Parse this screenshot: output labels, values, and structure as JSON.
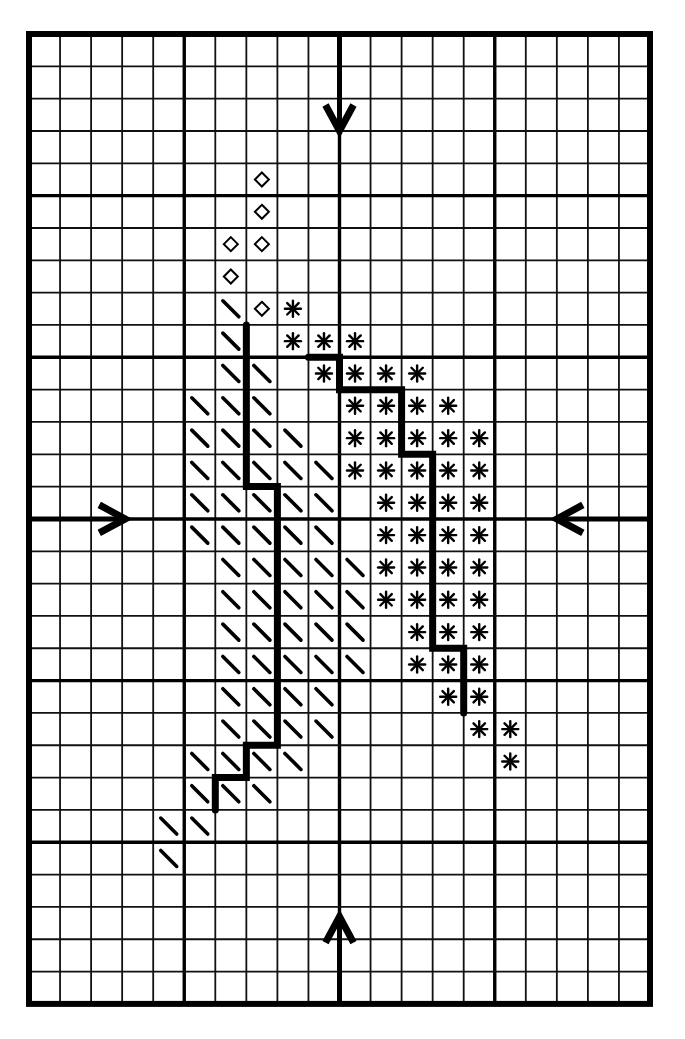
{
  "chart": {
    "grid": {
      "columns": 20,
      "rows": 30,
      "bold_every": 5,
      "origin_px": [
        29,
        34
      ],
      "cell_px": [
        31.05,
        32.33
      ]
    },
    "legend_symbols": [
      {
        "id": "diamond",
        "glyph": "◇"
      },
      {
        "id": "backslash",
        "glyph": "\\"
      },
      {
        "id": "asterisk",
        "glyph": "✳"
      }
    ],
    "stitches": {
      "diamond": [
        [
          4,
          7
        ],
        [
          5,
          7
        ],
        [
          6,
          6
        ],
        [
          6,
          7
        ],
        [
          7,
          6
        ],
        [
          8,
          7
        ]
      ],
      "backslash": [
        [
          8,
          6
        ],
        [
          9,
          6
        ],
        [
          10,
          6
        ],
        [
          10,
          7
        ],
        [
          11,
          5
        ],
        [
          11,
          6
        ],
        [
          11,
          7
        ],
        [
          12,
          5
        ],
        [
          12,
          6
        ],
        [
          12,
          7
        ],
        [
          12,
          8
        ],
        [
          13,
          5
        ],
        [
          13,
          6
        ],
        [
          13,
          7
        ],
        [
          13,
          8
        ],
        [
          13,
          9
        ],
        [
          14,
          5
        ],
        [
          14,
          6
        ],
        [
          14,
          7
        ],
        [
          14,
          8
        ],
        [
          14,
          9
        ],
        [
          15,
          5
        ],
        [
          15,
          6
        ],
        [
          15,
          7
        ],
        [
          15,
          8
        ],
        [
          15,
          9
        ],
        [
          16,
          6
        ],
        [
          16,
          7
        ],
        [
          16,
          8
        ],
        [
          16,
          9
        ],
        [
          16,
          10
        ],
        [
          17,
          6
        ],
        [
          17,
          7
        ],
        [
          17,
          8
        ],
        [
          17,
          9
        ],
        [
          17,
          10
        ],
        [
          18,
          6
        ],
        [
          18,
          7
        ],
        [
          18,
          8
        ],
        [
          18,
          9
        ],
        [
          18,
          10
        ],
        [
          19,
          6
        ],
        [
          19,
          7
        ],
        [
          19,
          8
        ],
        [
          19,
          9
        ],
        [
          19,
          10
        ],
        [
          20,
          6
        ],
        [
          20,
          7
        ],
        [
          20,
          8
        ],
        [
          20,
          9
        ],
        [
          21,
          6
        ],
        [
          21,
          7
        ],
        [
          21,
          8
        ],
        [
          21,
          9
        ],
        [
          22,
          5
        ],
        [
          22,
          6
        ],
        [
          22,
          7
        ],
        [
          22,
          8
        ],
        [
          23,
          5
        ],
        [
          23,
          6
        ],
        [
          23,
          7
        ],
        [
          24,
          4
        ],
        [
          24,
          5
        ],
        [
          25,
          4
        ]
      ],
      "asterisk": [
        [
          8,
          8
        ],
        [
          9,
          8
        ],
        [
          9,
          9
        ],
        [
          9,
          10
        ],
        [
          10,
          9
        ],
        [
          10,
          10
        ],
        [
          10,
          11
        ],
        [
          10,
          12
        ],
        [
          11,
          10
        ],
        [
          11,
          11
        ],
        [
          11,
          12
        ],
        [
          11,
          13
        ],
        [
          12,
          10
        ],
        [
          12,
          11
        ],
        [
          12,
          12
        ],
        [
          12,
          13
        ],
        [
          12,
          14
        ],
        [
          13,
          10
        ],
        [
          13,
          11
        ],
        [
          13,
          12
        ],
        [
          13,
          13
        ],
        [
          13,
          14
        ],
        [
          14,
          11
        ],
        [
          14,
          12
        ],
        [
          14,
          13
        ],
        [
          14,
          14
        ],
        [
          15,
          11
        ],
        [
          15,
          12
        ],
        [
          15,
          13
        ],
        [
          15,
          14
        ],
        [
          16,
          11
        ],
        [
          16,
          12
        ],
        [
          16,
          13
        ],
        [
          16,
          14
        ],
        [
          17,
          11
        ],
        [
          17,
          12
        ],
        [
          17,
          13
        ],
        [
          17,
          14
        ],
        [
          18,
          12
        ],
        [
          18,
          13
        ],
        [
          18,
          14
        ],
        [
          19,
          12
        ],
        [
          19,
          13
        ],
        [
          19,
          14
        ],
        [
          20,
          13
        ],
        [
          20,
          14
        ],
        [
          21,
          14
        ],
        [
          21,
          15
        ],
        [
          22,
          15
        ]
      ]
    },
    "backstitch_paths": [
      {
        "name": "left-backstitch",
        "points": [
          [
            7,
            9
          ],
          [
            7,
            14
          ],
          [
            8,
            14
          ],
          [
            8,
            22
          ],
          [
            7,
            22
          ],
          [
            7,
            23
          ],
          [
            6,
            23
          ],
          [
            6,
            24
          ]
        ]
      },
      {
        "name": "right-backstitch",
        "points": [
          [
            9,
            10
          ],
          [
            10,
            10
          ],
          [
            10,
            11
          ],
          [
            12,
            11
          ],
          [
            12,
            13
          ],
          [
            13,
            13
          ],
          [
            13,
            19
          ],
          [
            14,
            19
          ],
          [
            14,
            21
          ]
        ]
      }
    ],
    "center_arrows": [
      {
        "name": "top-center-arrow",
        "direction": "down",
        "from": [
          10,
          0
        ],
        "to": [
          10,
          3
        ]
      },
      {
        "name": "bottom-center-arrow",
        "direction": "up",
        "from": [
          10,
          30
        ],
        "to": [
          10,
          27.3
        ]
      },
      {
        "name": "left-center-arrow",
        "direction": "right",
        "from": [
          0,
          15
        ],
        "to": [
          3.1,
          15
        ]
      },
      {
        "name": "right-center-arrow",
        "direction": "left",
        "from": [
          20,
          15
        ],
        "to": [
          17,
          15
        ]
      }
    ],
    "colors": {
      "ink": "#000000",
      "paper": "#ffffff"
    }
  }
}
